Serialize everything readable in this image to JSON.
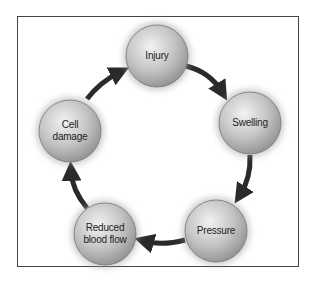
{
  "diagram": {
    "type": "cycle",
    "nodes": [
      {
        "id": "injury",
        "label": "Injury",
        "cx": 157,
        "cy": 56
      },
      {
        "id": "swelling",
        "label": "Swelling",
        "cx": 250,
        "cy": 123
      },
      {
        "id": "pressure",
        "label": "Pressure",
        "cx": 216,
        "cy": 231
      },
      {
        "id": "reduced",
        "label": "Reduced blood flow",
        "line1": "Reduced",
        "line2": "blood flow",
        "cx": 105,
        "cy": 234
      },
      {
        "id": "cell",
        "label": "Cell damage",
        "line1": "Cell",
        "line2": "damage",
        "cx": 70,
        "cy": 131
      }
    ],
    "edges": [
      {
        "from": "injury",
        "to": "swelling"
      },
      {
        "from": "swelling",
        "to": "pressure"
      },
      {
        "from": "pressure",
        "to": "reduced"
      },
      {
        "from": "reduced",
        "to": "cell"
      },
      {
        "from": "cell",
        "to": "injury"
      }
    ],
    "colors": {
      "node_fill": "#bdbdbd",
      "arrow": "#2a2a2a",
      "border": "#444444"
    }
  }
}
